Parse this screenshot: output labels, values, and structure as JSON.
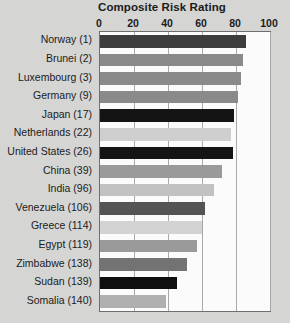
{
  "chart_data": {
    "type": "bar",
    "orientation": "horizontal",
    "title": "Composite Risk Rating",
    "xlabel": "",
    "ylabel": "",
    "xlim": [
      0,
      100
    ],
    "xticks": [
      0,
      20,
      40,
      60,
      80,
      100
    ],
    "xtick_labels": [
      "0",
      "20",
      "40",
      "60",
      "80",
      "100"
    ],
    "grid": true,
    "grid_axis": "x",
    "legend": false,
    "categories": [
      "Norway (1)",
      "Brunei (2)",
      "Luxembourg (3)",
      "Germany (9)",
      "Japan (17)",
      "Netherlands (22)",
      "United States (26)",
      "China (39)",
      "India (96)",
      "Venezuela (106)",
      "Greece (114)",
      "Egypt (119)",
      "Zimbabwe (138)",
      "Sudan (139)",
      "Somalia (140)"
    ],
    "values": [
      86,
      84,
      83,
      81,
      79,
      77,
      78,
      72,
      67,
      62,
      60,
      57,
      51,
      45,
      39
    ],
    "bar_colors": [
      "#3d3d3d",
      "#8a8a8a",
      "#8a8a8a",
      "#8a8a8a",
      "#141414",
      "#cfcfcf",
      "#141414",
      "#9a9a9a",
      "#c2c2c2",
      "#545454",
      "#d3d3d3",
      "#9a9a9a",
      "#737373",
      "#0f0f0f",
      "#b0b0b0"
    ]
  },
  "caption": {
    "clipped_footer_text": ""
  }
}
